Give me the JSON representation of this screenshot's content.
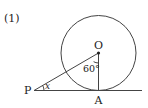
{
  "problem": {
    "number_label": "(1)"
  },
  "diagram": {
    "circle": {
      "cx": 98.5,
      "cy": 53,
      "r": 37.5
    },
    "points": {
      "O": {
        "label": "O",
        "x": 98.5,
        "y": 53
      },
      "A": {
        "label": "A",
        "x": 98.5,
        "y": 90.5
      },
      "P": {
        "label": "P",
        "x": 34,
        "y": 90.5
      }
    },
    "angles": {
      "AOP": {
        "label": "60°"
      },
      "APO": {
        "label": "x"
      }
    },
    "tangent_line": {
      "x1": 34,
      "x2": 142,
      "y": 90.5
    },
    "colors": {
      "stroke": "#444444",
      "text": "#222222"
    }
  }
}
